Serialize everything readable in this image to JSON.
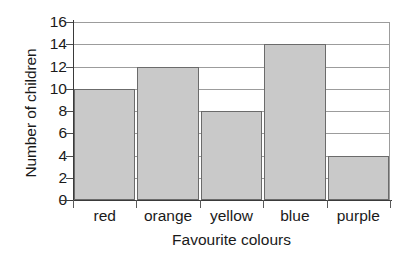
{
  "chart_data": {
    "type": "bar",
    "title": "",
    "xlabel": "Favourite colours",
    "ylabel": "Number of children",
    "categories": [
      "red",
      "orange",
      "yellow",
      "blue",
      "purple"
    ],
    "values": [
      10,
      12,
      8,
      14,
      4
    ],
    "ylim": [
      0,
      16
    ],
    "ytick_step": 2,
    "yticks": [
      0,
      2,
      4,
      6,
      8,
      10,
      12,
      14,
      16
    ],
    "ytick_labels": [
      "0",
      "2",
      "4",
      "6",
      "8",
      "10",
      "12",
      "14",
      "16"
    ],
    "grid": "horizontal",
    "legend": "none",
    "bar_fill": "#c9c9c9",
    "bar_border": "#6b6b6b",
    "axis_color": "#3a3a3a",
    "gridline_color": "#9c9c9c",
    "background": "#ffffff"
  }
}
